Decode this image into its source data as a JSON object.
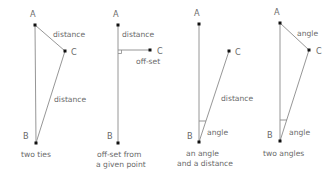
{
  "colors": {
    "line": "#8a8a8a",
    "point": "#111111",
    "text": "#6a6a6a",
    "background": "#ffffff"
  },
  "diagrams": [
    {
      "caption": [
        "two ties"
      ],
      "points": {
        "A": "A",
        "B": "B",
        "C": "C"
      },
      "labels": {
        "ac": "distance",
        "bc": "distance"
      }
    },
    {
      "caption": [
        "off-set from",
        "a given point"
      ],
      "points": {
        "A": "A",
        "B": "B",
        "C": "C"
      },
      "labels": {
        "a_foot": "distance",
        "offset": "off-set"
      }
    },
    {
      "caption": [
        "an angle",
        "and a distance"
      ],
      "points": {
        "A": "A",
        "B": "B",
        "C": "C"
      },
      "labels": {
        "bc": "distance",
        "angle_b": "angle"
      }
    },
    {
      "caption": [
        "two angles"
      ],
      "points": {
        "A": "A",
        "B": "B",
        "C": "C"
      },
      "labels": {
        "angle_a": "angle",
        "angle_b": "angle"
      }
    }
  ]
}
